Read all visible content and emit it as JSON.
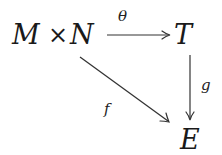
{
  "diagram": {
    "type": "commutative-diagram",
    "nodes": {
      "source": {
        "left": "M",
        "op": "×",
        "right": "N"
      },
      "top_right": "T",
      "bottom_right": "E"
    },
    "arrows": [
      {
        "id": "theta",
        "from": "M × N",
        "to": "T",
        "label": "θ"
      },
      {
        "id": "g",
        "from": "T",
        "to": "E",
        "label": "g"
      },
      {
        "id": "f",
        "from": "M × N",
        "to": "E",
        "label": "f"
      }
    ]
  }
}
